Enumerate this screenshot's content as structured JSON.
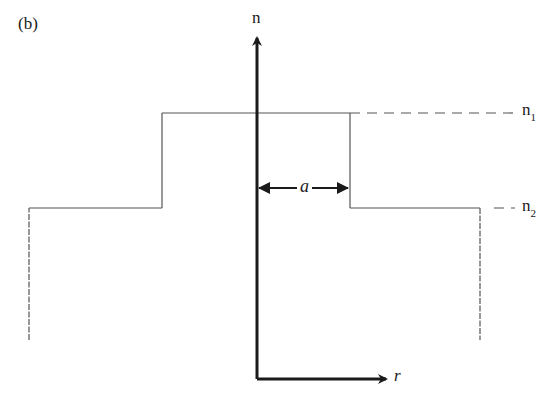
{
  "figure": {
    "panel_label": "(b)",
    "vertical_axis_label": "n",
    "horizontal_axis_label": "r",
    "core_half_width_label": "a",
    "levels": [
      {
        "symbol": "n",
        "subscript": "1",
        "description": "core refractive index"
      },
      {
        "symbol": "n",
        "subscript": "2",
        "description": "cladding refractive index"
      }
    ]
  },
  "colors": {
    "line": "#555555",
    "axis": "#1a1a1a",
    "background": "#ffffff"
  }
}
